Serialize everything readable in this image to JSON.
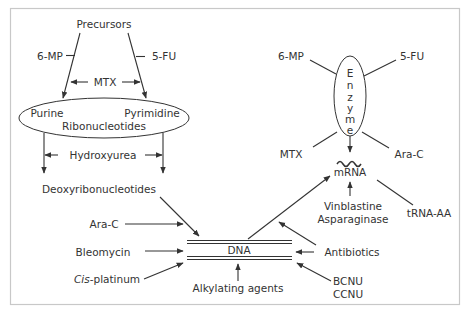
{
  "diagram": {
    "title": "",
    "colors": {
      "line": "#333333",
      "frame": "#c8c8c8",
      "background": "#ffffff"
    },
    "nucleotide_pathway": {
      "precursors": "Precursors",
      "inhibitors_top": {
        "left": "6-MP",
        "right": "5-FU",
        "middle": "MTX"
      },
      "ribonucleotides_ellipse": {
        "purine": "Purine",
        "pyrimidine": "Pyrimidine",
        "ribonucleotides": "Ribonucleotides"
      },
      "hydroxyurea": "Hydroxyurea",
      "deoxyribonucleotides": "Deoxyribonucleotides"
    },
    "enzyme": {
      "label_letters": [
        "E",
        "n",
        "z",
        "y",
        "m",
        "e"
      ],
      "inhibitors": {
        "top_left": "6-MP",
        "top_right": "5-FU",
        "bottom_left": "MTX",
        "bottom_right": "Ara-C"
      }
    },
    "mrna": {
      "label": "mRNA",
      "inhibitors_below": [
        "Vinblastine",
        "Asparaginase"
      ],
      "trna": "tRNA-AA"
    },
    "dna": {
      "label": "DNA",
      "left_inputs": {
        "ara_c": "Ara-C",
        "bleomycin": "Bleomycin",
        "cisplatinum_prefix": "Cis",
        "cisplatinum_suffix": "-platinum"
      },
      "right_inputs": {
        "antibiotics": "Antibiotics",
        "bcnu": "BCNU",
        "ccnu": "CCNU"
      },
      "bottom_input": "Alkylating agents"
    }
  }
}
